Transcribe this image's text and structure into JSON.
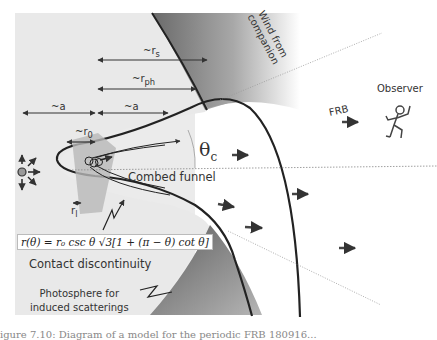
{
  "diagram": {
    "type": "schematic",
    "labels": {
      "r_s": "~r",
      "r_s_sub": "s",
      "r_ph": "~r",
      "r_ph_sub": "ph",
      "a_left": "~a",
      "a_right": "~a",
      "r0": "~r",
      "r0_sub": "0",
      "rl": "r",
      "rl_sub": "l",
      "theta_c": "θ",
      "theta_c_sub": "c",
      "wind": "Wind from",
      "wind_line2": "companion",
      "observer": "Observer",
      "frb": "FRB",
      "combed_funnel": "Combed funnel",
      "formula": "r(θ) = r₀ csc θ √3[1 + (π − θ) cot θ]",
      "contact_discontinuity": "Contact discontinuity",
      "photosphere_line1": "Photosphere for",
      "photosphere_line2": "induced scatterings"
    },
    "colors": {
      "background_gray": "#ebebeb",
      "companion_dark": "#6f6f6f",
      "curve": "#222222",
      "arrow": "#444444",
      "dotted_line": "#888888"
    },
    "caption_partial": "igure 7.10: Diagram of a model for the periodic FRB 180916..."
  }
}
